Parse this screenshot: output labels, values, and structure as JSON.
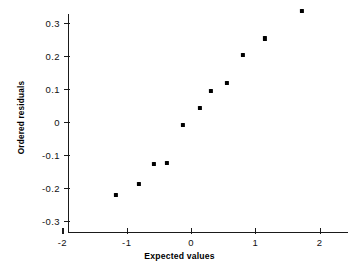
{
  "chart_data": {
    "type": "scatter",
    "title": "",
    "xlabel": "Expected values",
    "ylabel": "Ordered residuals",
    "xlim": [
      -2.3,
      2.45
    ],
    "ylim": [
      -0.335,
      0.355
    ],
    "xticks": [
      -2,
      -1,
      0,
      1,
      2
    ],
    "xticklabels": [
      "-2",
      "-1",
      "0",
      "1",
      "2"
    ],
    "yticks": [
      -0.3,
      -0.2,
      -0.1,
      0,
      0.1,
      0.2,
      0.3
    ],
    "yticklabels": [
      "-0.3",
      "-0.2",
      "-0.1",
      "0",
      "0.1",
      "0.2",
      "0.3"
    ],
    "grid": false,
    "legend": null,
    "marker": "filled-square",
    "marker_color": "#000000",
    "x": [
      -1.17,
      -0.81,
      -0.58,
      -0.37,
      -0.12,
      0.14,
      0.31,
      0.56,
      0.81,
      1.15,
      1.73
    ],
    "y": [
      -0.223,
      -0.189,
      -0.129,
      -0.125,
      -0.011,
      0.04,
      0.093,
      0.116,
      0.201,
      0.252,
      0.334
    ],
    "points": [
      {
        "x": -1.17,
        "y": -0.223
      },
      {
        "x": -0.81,
        "y": -0.189
      },
      {
        "x": -0.58,
        "y": -0.129
      },
      {
        "x": -0.37,
        "y": -0.125
      },
      {
        "x": -0.12,
        "y": -0.011
      },
      {
        "x": 0.14,
        "y": 0.04
      },
      {
        "x": 0.31,
        "y": 0.093
      },
      {
        "x": 0.56,
        "y": 0.116
      },
      {
        "x": 0.81,
        "y": 0.201
      },
      {
        "x": 1.15,
        "y": 0.252
      },
      {
        "x": 1.73,
        "y": 0.334
      }
    ]
  },
  "axis_labels": {
    "x_title": "Expected values",
    "y_title": "Ordered residuals"
  }
}
